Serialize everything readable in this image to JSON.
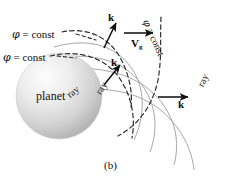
{
  "figure": {
    "caption": "(b)",
    "planet_label": "planet",
    "background_color": "#ffffff",
    "ink_color": "#111111",
    "ray_curve_color": "#9a9a9a",
    "wavefront_curve_color": "#3a3a3a",
    "planet_fill_light": "#f4f4f4",
    "planet_fill_dark": "#b4b4b4"
  },
  "wavefront_labels": [
    {
      "id": "phi-top",
      "phi": "φ",
      "equals": " = const"
    },
    {
      "id": "phi-mid",
      "phi": "φ",
      "equals": " = const"
    },
    {
      "id": "phi-right",
      "phi": "φ",
      "equals": " = const"
    }
  ],
  "ray_labels": [
    {
      "id": "ray-inner",
      "text": "ray"
    },
    {
      "id": "ray-middle",
      "text": "ray"
    },
    {
      "id": "ray-outer",
      "text": "ray"
    }
  ],
  "vectors": [
    {
      "id": "k-top",
      "symbol": "k",
      "subscript": ""
    },
    {
      "id": "k-middle",
      "symbol": "k",
      "subscript": ""
    },
    {
      "id": "k-right",
      "symbol": "k",
      "subscript": ""
    },
    {
      "id": "vg",
      "symbol": "V",
      "subscript": "g"
    }
  ]
}
